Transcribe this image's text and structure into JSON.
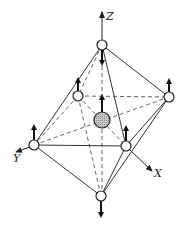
{
  "diagram": {
    "type": "octahedral-molecule-vibration",
    "axes": [
      {
        "name": "Z",
        "label": "Z"
      },
      {
        "name": "X",
        "label": "X"
      },
      {
        "name": "Y",
        "label": "Y"
      }
    ],
    "colors": {
      "central_fill": "#b0b0b0",
      "ligand_fill": "#ffffff",
      "line": "#333333"
    },
    "atoms": [
      {
        "id": "top",
        "kind": "ligand",
        "displacement": "down"
      },
      {
        "id": "back-left",
        "kind": "ligand",
        "displacement": "up"
      },
      {
        "id": "right",
        "kind": "ligand",
        "displacement": "up"
      },
      {
        "id": "left",
        "kind": "ligand",
        "displacement": "up"
      },
      {
        "id": "front-right",
        "kind": "ligand",
        "displacement": "up"
      },
      {
        "id": "bottom",
        "kind": "ligand",
        "displacement": "down"
      },
      {
        "id": "center",
        "kind": "central",
        "displacement": "up"
      }
    ]
  }
}
